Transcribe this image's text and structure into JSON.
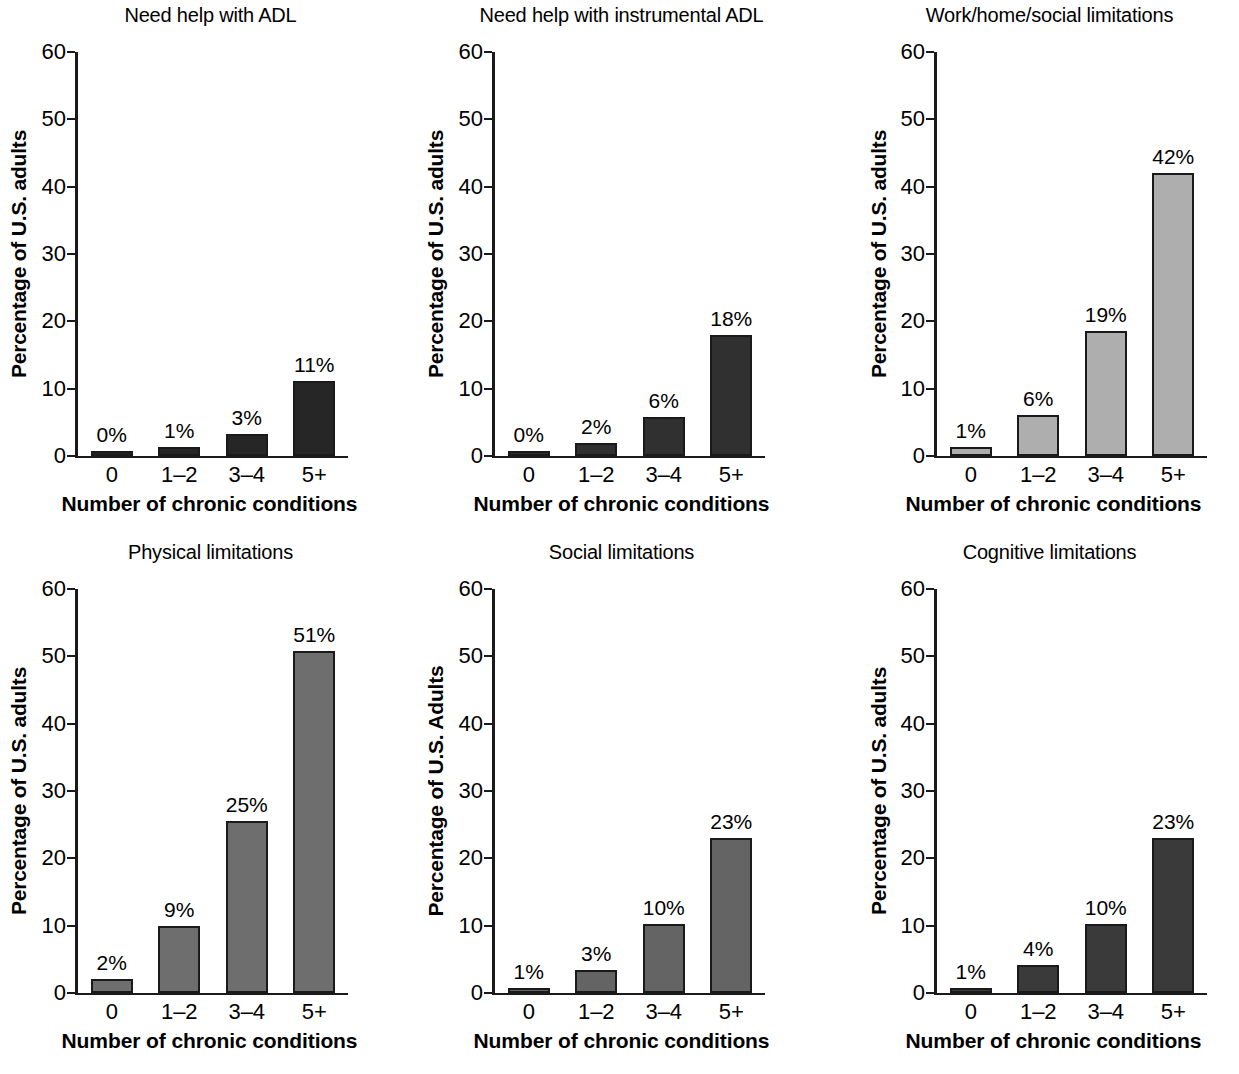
{
  "figure": {
    "categories": [
      "0",
      "1–2",
      "3–4",
      "5+"
    ],
    "y_ticks": [
      "0",
      "10",
      "20",
      "30",
      "40",
      "50",
      "60"
    ],
    "y_tick_values": [
      0,
      10,
      20,
      30,
      40,
      50,
      60
    ],
    "ylim": [
      0,
      60
    ],
    "xlabel": "Number of chronic conditions"
  },
  "chart_data": [
    {
      "type": "bar",
      "title": "Need help with ADL",
      "xlabel": "Number of chronic conditions",
      "ylabel": "Percentage of U.S. adults",
      "categories": [
        "0",
        "1–2",
        "3–4",
        "5+"
      ],
      "values": [
        0.6,
        1.3,
        3.3,
        11.2
      ],
      "labels": [
        "0%",
        "1%",
        "3%",
        "11%"
      ],
      "ylim": [
        0,
        60
      ],
      "yticks": [
        0,
        10,
        20,
        30,
        40,
        50,
        60
      ],
      "grid": false,
      "legend": "none",
      "bar_color": "#262626"
    },
    {
      "type": "bar",
      "title": "Need help with instrumental ADL",
      "xlabel": "Number of chronic conditions",
      "ylabel": "Percentage of U.S. adults",
      "categories": [
        "0",
        "1–2",
        "3–4",
        "5+"
      ],
      "values": [
        0.7,
        2.0,
        5.8,
        18.0
      ],
      "labels": [
        "0%",
        "2%",
        "6%",
        "18%"
      ],
      "ylim": [
        0,
        60
      ],
      "yticks": [
        0,
        10,
        20,
        30,
        40,
        50,
        60
      ],
      "grid": false,
      "legend": "none",
      "bar_color": "#303030"
    },
    {
      "type": "bar",
      "title": "Work/home/social limitations",
      "xlabel": "Number of chronic conditions",
      "ylabel": "Percentage of U.S. adults",
      "categories": [
        "0",
        "1–2",
        "3–4",
        "5+"
      ],
      "values": [
        1.4,
        6.1,
        18.5,
        42.0
      ],
      "labels": [
        "1%",
        "6%",
        "19%",
        "42%"
      ],
      "ylim": [
        0,
        60
      ],
      "yticks": [
        0,
        10,
        20,
        30,
        40,
        50,
        60
      ],
      "grid": false,
      "legend": "none",
      "bar_color": "#aeaeae"
    },
    {
      "type": "bar",
      "title": "Physical limitations",
      "xlabel": "Number of chronic conditions",
      "ylabel": "Percentage of U.S. adults",
      "categories": [
        "0",
        "1–2",
        "3–4",
        "5+"
      ],
      "values": [
        2.1,
        10.0,
        25.6,
        50.8
      ],
      "labels": [
        "2%",
        "9%",
        "25%",
        "51%"
      ],
      "ylim": [
        0,
        60
      ],
      "yticks": [
        0,
        10,
        20,
        30,
        40,
        50,
        60
      ],
      "grid": false,
      "legend": "none",
      "bar_color": "#6e6e6e"
    },
    {
      "type": "bar",
      "title": "Social limitations",
      "xlabel": "Number of chronic conditions",
      "ylabel": "Percentage of U.S. Adults",
      "categories": [
        "0",
        "1–2",
        "3–4",
        "5+"
      ],
      "values": [
        0.7,
        3.4,
        10.3,
        23.0
      ],
      "labels": [
        "1%",
        "3%",
        "10%",
        "23%"
      ],
      "ylim": [
        0,
        60
      ],
      "yticks": [
        0,
        10,
        20,
        30,
        40,
        50,
        60
      ],
      "grid": false,
      "legend": "none",
      "bar_color": "#646464"
    },
    {
      "type": "bar",
      "title": "Cognitive limitations",
      "xlabel": "Number of chronic conditions",
      "ylabel": "Percentage of U.S. adults",
      "categories": [
        "0",
        "1–2",
        "3–4",
        "5+"
      ],
      "values": [
        0.8,
        4.1,
        10.3,
        23.0
      ],
      "labels": [
        "1%",
        "4%",
        "10%",
        "23%"
      ],
      "ylim": [
        0,
        60
      ],
      "yticks": [
        0,
        10,
        20,
        30,
        40,
        50,
        60
      ],
      "grid": false,
      "legend": "none",
      "bar_color": "#3a3a3a"
    }
  ]
}
